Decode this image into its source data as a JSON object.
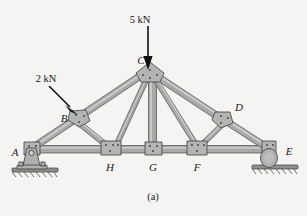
{
  "figure": {
    "caption": "(a)",
    "type": "plane-truss-diagram",
    "background_color": "#f4f4f2",
    "member_color": "#a8a8a8",
    "member_outline_color": "#4a4a4a",
    "label_color": "#1a1a1a"
  },
  "loads": [
    {
      "id": "load-5kn",
      "label": "5 kN",
      "magnitude": 5,
      "unit": "kN",
      "applied_at": "C",
      "direction": "down",
      "label_x": 157,
      "label_y": 19,
      "tail_x": 148,
      "tail_y": 26,
      "head_x": 148,
      "head_y": 68
    },
    {
      "id": "load-2kn",
      "label": "2 kN",
      "magnitude": 2,
      "unit": "kN",
      "applied_at": "B",
      "direction": "down-right",
      "label_x": 46,
      "label_y": 79,
      "tail_x": 49,
      "tail_y": 86,
      "head_x": 77,
      "head_y": 114
    }
  ],
  "joints": [
    {
      "name": "A",
      "x": 28,
      "y": 152,
      "label_x": 17,
      "label_y": 152,
      "gusset": "pin-support"
    },
    {
      "name": "B",
      "x": 79,
      "y": 118,
      "label_x": 64,
      "label_y": 118,
      "gusset": "polygon"
    },
    {
      "name": "C",
      "x": 150,
      "y": 71,
      "label_x": 140,
      "label_y": 66,
      "gusset": "apex"
    },
    {
      "name": "D",
      "x": 223,
      "y": 118,
      "label_x": 238,
      "label_y": 110,
      "gusset": "polygon"
    },
    {
      "name": "E",
      "x": 273,
      "y": 151,
      "label_x": 288,
      "label_y": 152,
      "gusset": "roller-support"
    },
    {
      "name": "H",
      "x": 110,
      "y": 149,
      "label_x": 110,
      "label_y": 168,
      "gusset": "polygon"
    },
    {
      "name": "G",
      "x": 153,
      "y": 149,
      "label_x": 153,
      "label_y": 168,
      "gusset": "polygon"
    },
    {
      "name": "F",
      "x": 197,
      "y": 149,
      "label_x": 197,
      "label_y": 168,
      "gusset": "polygon"
    }
  ],
  "members": [
    {
      "id": "AB",
      "from": "A",
      "to": "B",
      "kind": "top-chord"
    },
    {
      "id": "BC",
      "from": "B",
      "to": "C",
      "kind": "top-chord"
    },
    {
      "id": "CD",
      "from": "C",
      "to": "D",
      "kind": "top-chord"
    },
    {
      "id": "DE",
      "from": "D",
      "to": "E",
      "kind": "top-chord"
    },
    {
      "id": "AH",
      "from": "A",
      "to": "H",
      "kind": "bottom-chord"
    },
    {
      "id": "HG",
      "from": "H",
      "to": "G",
      "kind": "bottom-chord"
    },
    {
      "id": "GF",
      "from": "G",
      "to": "F",
      "kind": "bottom-chord"
    },
    {
      "id": "FE",
      "from": "F",
      "to": "E",
      "kind": "bottom-chord"
    },
    {
      "id": "BH",
      "from": "B",
      "to": "H",
      "kind": "web"
    },
    {
      "id": "HC",
      "from": "H",
      "to": "C",
      "kind": "web"
    },
    {
      "id": "CG",
      "from": "C",
      "to": "G",
      "kind": "web-vertical"
    },
    {
      "id": "CF",
      "from": "C",
      "to": "F",
      "kind": "web"
    },
    {
      "id": "FD",
      "from": "F",
      "to": "D",
      "kind": "web"
    }
  ],
  "supports": [
    {
      "at": "A",
      "type": "pin",
      "name": "pin-support"
    },
    {
      "at": "E",
      "type": "roller",
      "name": "roller-support"
    }
  ]
}
